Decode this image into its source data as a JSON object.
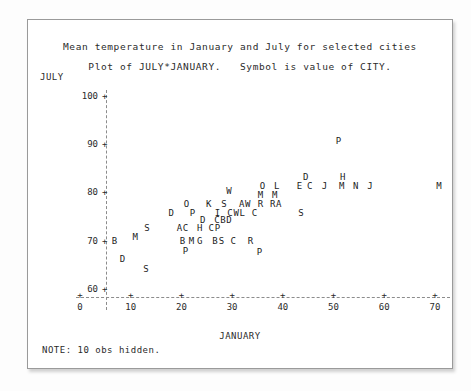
{
  "titles": {
    "line1": "Mean temperature in January and July for selected cities",
    "line2": "Plot of JULY*JANUARY.   Symbol is value of CITY."
  },
  "note": "NOTE: 10 obs hidden.",
  "axes": {
    "y_label": "JULY",
    "x_label": "JANUARY",
    "y_ticks": [
      "100",
      "90",
      "80",
      "70",
      "60"
    ],
    "x_ticks": [
      "0",
      "10",
      "20",
      "30",
      "40",
      "50",
      "60",
      "70"
    ],
    "tick_mark": "+"
  },
  "chart_data": {
    "type": "scatter",
    "title": "Mean temperature in January and July for selected cities",
    "subtitle": "Plot of JULY*JANUARY.   Symbol is value of CITY.",
    "xlabel": "JANUARY",
    "ylabel": "JULY",
    "xlim": [
      -2,
      73
    ],
    "ylim": [
      57,
      103
    ],
    "xticks": [
      0,
      10,
      20,
      30,
      40,
      50,
      60,
      70
    ],
    "yticks": [
      60,
      70,
      80,
      90,
      100
    ],
    "grid": false,
    "legend": null,
    "symbol_meaning": "first letter of CITY",
    "hidden_obs": 10,
    "points": [
      {
        "label": "P",
        "x": 51.0,
        "y": 90.6
      },
      {
        "label": "D",
        "x": 44.5,
        "y": 83.2
      },
      {
        "label": "H",
        "x": 51.8,
        "y": 83.2
      },
      {
        "label": "O",
        "x": 36.0,
        "y": 81.4
      },
      {
        "label": "L",
        "x": 38.8,
        "y": 81.4
      },
      {
        "label": "E",
        "x": 43.3,
        "y": 81.4
      },
      {
        "label": "C",
        "x": 45.3,
        "y": 81.4
      },
      {
        "label": "J",
        "x": 48.2,
        "y": 81.4
      },
      {
        "label": "M",
        "x": 51.6,
        "y": 81.4
      },
      {
        "label": "N",
        "x": 54.4,
        "y": 81.4
      },
      {
        "label": "J",
        "x": 57.2,
        "y": 81.4
      },
      {
        "label": "M",
        "x": 70.8,
        "y": 81.4
      },
      {
        "label": "W",
        "x": 29.4,
        "y": 80.2
      },
      {
        "label": "M",
        "x": 35.6,
        "y": 79.4
      },
      {
        "label": "M",
        "x": 38.4,
        "y": 79.4
      },
      {
        "label": "O",
        "x": 21.0,
        "y": 77.6
      },
      {
        "label": "K",
        "x": 25.4,
        "y": 77.6
      },
      {
        "label": "S",
        "x": 28.4,
        "y": 77.6
      },
      {
        "label": "A",
        "x": 31.9,
        "y": 77.6
      },
      {
        "label": "W",
        "x": 33.1,
        "y": 77.6
      },
      {
        "label": "R",
        "x": 35.6,
        "y": 77.6
      },
      {
        "label": "R",
        "x": 38.0,
        "y": 77.6
      },
      {
        "label": "A",
        "x": 39.2,
        "y": 77.6
      },
      {
        "label": "D",
        "x": 18.0,
        "y": 75.8
      },
      {
        "label": "P",
        "x": 22.2,
        "y": 75.8
      },
      {
        "label": "I",
        "x": 27.1,
        "y": 75.8
      },
      {
        "label": "C",
        "x": 29.6,
        "y": 75.8
      },
      {
        "label": "W",
        "x": 30.8,
        "y": 75.8
      },
      {
        "label": "L",
        "x": 32.0,
        "y": 75.8
      },
      {
        "label": "C",
        "x": 34.4,
        "y": 75.8
      },
      {
        "label": "S",
        "x": 43.6,
        "y": 75.8
      },
      {
        "label": "D",
        "x": 24.2,
        "y": 74.2
      },
      {
        "label": "C",
        "x": 27.0,
        "y": 74.2
      },
      {
        "label": "B",
        "x": 28.2,
        "y": 74.2
      },
      {
        "label": "D",
        "x": 29.4,
        "y": 74.2
      },
      {
        "label": "S",
        "x": 13.2,
        "y": 72.6
      },
      {
        "label": "A",
        "x": 19.6,
        "y": 72.6
      },
      {
        "label": "C",
        "x": 20.8,
        "y": 72.6
      },
      {
        "label": "H",
        "x": 23.6,
        "y": 72.6
      },
      {
        "label": "C",
        "x": 25.9,
        "y": 72.6
      },
      {
        "label": "P",
        "x": 27.1,
        "y": 72.6
      },
      {
        "label": "M",
        "x": 10.9,
        "y": 70.8
      },
      {
        "label": "B",
        "x": 6.8,
        "y": 70.0
      },
      {
        "label": "B",
        "x": 20.2,
        "y": 70.0
      },
      {
        "label": "M",
        "x": 22.0,
        "y": 70.0
      },
      {
        "label": "G",
        "x": 23.6,
        "y": 70.0
      },
      {
        "label": "B",
        "x": 26.6,
        "y": 70.0
      },
      {
        "label": "S",
        "x": 27.9,
        "y": 70.0
      },
      {
        "label": "C",
        "x": 30.2,
        "y": 70.0
      },
      {
        "label": "R",
        "x": 33.6,
        "y": 70.0
      },
      {
        "label": "P",
        "x": 20.8,
        "y": 67.8
      },
      {
        "label": "P",
        "x": 35.4,
        "y": 67.6
      },
      {
        "label": "D",
        "x": 8.4,
        "y": 66.2
      },
      {
        "label": "S",
        "x": 13.0,
        "y": 64.2
      }
    ]
  }
}
